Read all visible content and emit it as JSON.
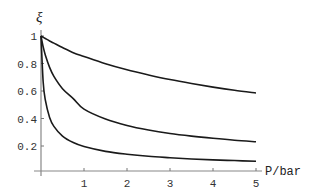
{
  "chart_data": {
    "type": "line",
    "title": "",
    "xlabel": "P/bar",
    "ylabel": "ξ",
    "xlim": [
      0,
      5
    ],
    "ylim": [
      0,
      1
    ],
    "grid": false,
    "legend": "none",
    "x_ticks": [
      1,
      2,
      3,
      4,
      5
    ],
    "x_tick_labels": [
      "1",
      "2",
      "3",
      "4",
      "5"
    ],
    "y_ticks": [
      0.2,
      0.4,
      0.6,
      0.8,
      1
    ],
    "y_tick_labels": [
      "0.2",
      "0.4",
      "0.6",
      "0.8",
      "1"
    ],
    "x": [
      0,
      0.05,
      0.1,
      0.2,
      0.3,
      0.5,
      0.75,
      1,
      1.5,
      2,
      2.5,
      3,
      3.5,
      4,
      4.5,
      5
    ],
    "series": [
      {
        "name": "curve-1",
        "values": [
          1.0,
          0.991,
          0.982,
          0.964,
          0.948,
          0.916,
          0.879,
          0.851,
          0.798,
          0.754,
          0.717,
          0.683,
          0.654,
          0.628,
          0.605,
          0.586
        ]
      },
      {
        "name": "curve-2",
        "values": [
          1.0,
          0.922,
          0.862,
          0.772,
          0.706,
          0.617,
          0.545,
          0.468,
          0.396,
          0.349,
          0.316,
          0.291,
          0.272,
          0.256,
          0.242,
          0.231
        ]
      },
      {
        "name": "curve-3",
        "values": [
          1.0,
          0.667,
          0.535,
          0.408,
          0.343,
          0.272,
          0.225,
          0.196,
          0.161,
          0.14,
          0.125,
          0.115,
          0.106,
          0.099,
          0.094,
          0.089
        ]
      }
    ]
  }
}
